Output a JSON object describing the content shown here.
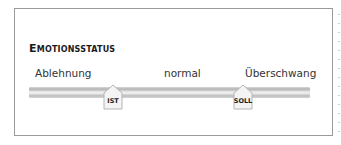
{
  "panel": {
    "title": "Emotionsstatus",
    "scale_labels": {
      "left": "Ablehnung",
      "middle": "normal",
      "right": "Überschwang"
    },
    "markers": [
      {
        "id": "ist",
        "label": "IST"
      },
      {
        "id": "soll",
        "label": "SOLL"
      }
    ]
  }
}
